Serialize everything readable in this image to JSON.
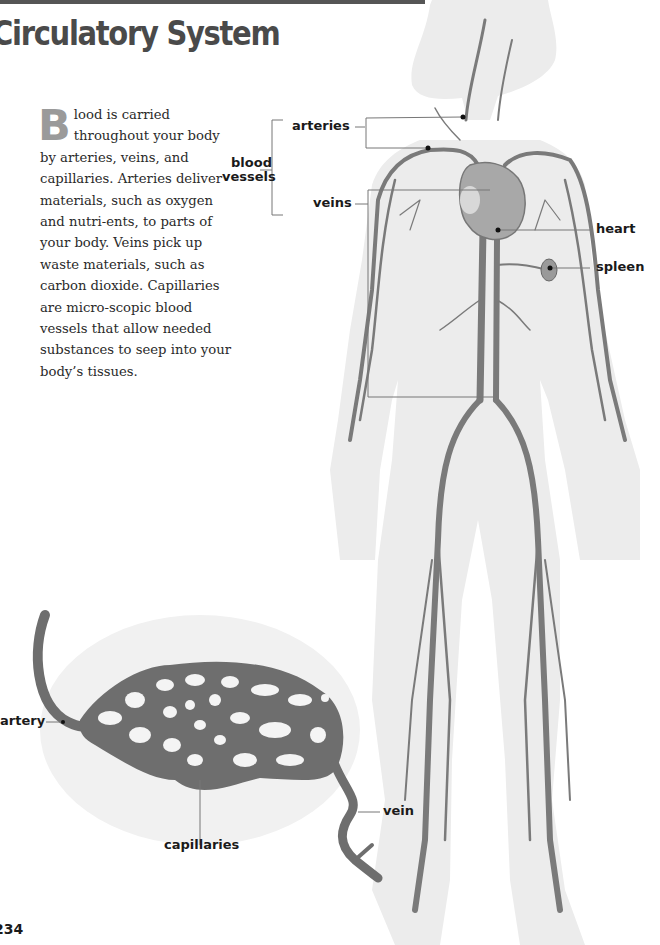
{
  "page": {
    "title": "Circulatory System",
    "page_number": "234"
  },
  "article": {
    "drop_cap": "B",
    "text": "lood is carried throughout your body by arteries, veins, and capillaries. Arteries deliver materials, such as oxygen and nutri-ents, to parts of your body. Veins pick up waste materials, such as carbon dioxide. Capillaries are micro-scopic blood vessels that allow needed substances to seep into your body’s tissues."
  },
  "body_diagram": {
    "labels": {
      "group": "blood vessels",
      "arteries": "arteries",
      "veins": "veins",
      "heart": "heart",
      "spleen": "spleen"
    }
  },
  "capillary_diagram": {
    "labels": {
      "artery": "artery",
      "capillaries": "capillaries",
      "vein": "vein"
    }
  },
  "colors": {
    "title": "#4a4a4a",
    "drop_cap": "#9a9a9a",
    "silhouette": "#ececec",
    "vessel": "#7a7a7a",
    "capillary_bg": "#f1f1f1"
  }
}
